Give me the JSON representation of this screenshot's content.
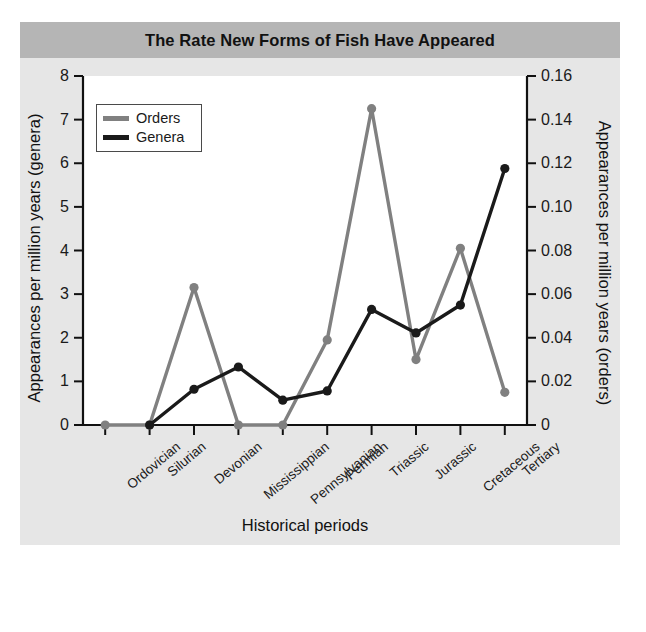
{
  "figure": {
    "title": "The Rate New Forms of Fish Have Appeared",
    "background_color": "#e6e6e6",
    "title_band_color": "#b5b5b5",
    "plot_background_color": "#ffffff"
  },
  "legend": {
    "position": "top-left-inside",
    "entries": [
      {
        "label": "Orders",
        "color": "#808080"
      },
      {
        "label": "Genera",
        "color": "#1a1a1a"
      }
    ]
  },
  "axes": {
    "x_title": "Historical periods",
    "y_left_title": "Appearances per million years (genera)",
    "y_right_title": "Appearances per million years (orders)",
    "y_left_ticks": [
      "0",
      "1",
      "2",
      "3",
      "4",
      "5",
      "6",
      "7",
      "8"
    ],
    "y_right_ticks": [
      "0",
      "0.02",
      "0.04",
      "0.06",
      "0.08",
      "0.10",
      "0.12",
      "0.14",
      "0.16"
    ]
  },
  "chart_data": {
    "type": "line",
    "title": "The Rate New Forms of Fish Have Appeared",
    "xlabel": "Historical periods",
    "ylabel": "Appearances per million years (genera)",
    "y2label": "Appearances per million years (orders)",
    "categories": [
      "Ordovician",
      "Silurian",
      "Devonian",
      "Mississippian",
      "Pennsylvanian",
      "Permian",
      "Triassic",
      "Jurassic",
      "Cretaceous",
      "Tertiary"
    ],
    "ylim": [
      0,
      8
    ],
    "y2lim": [
      0,
      0.16
    ],
    "ytick_step": 1,
    "y2tick_step": 0.02,
    "grid": false,
    "markers": true,
    "series": [
      {
        "name": "Orders",
        "axis": "right",
        "color": "#808080",
        "values": [
          0.0,
          0.0,
          0.063,
          0.0,
          0.0,
          0.039,
          0.145,
          0.03,
          0.081,
          0.015
        ],
        "values_left_scale": [
          0.0,
          0.0,
          3.15,
          0.0,
          0.0,
          1.95,
          7.27,
          1.5,
          4.06,
          0.73
        ]
      },
      {
        "name": "Genera",
        "axis": "left",
        "color": "#1a1a1a",
        "values": [
          null,
          0.0,
          0.82,
          1.33,
          0.57,
          0.78,
          2.65,
          2.11,
          2.75,
          5.88
        ]
      }
    ]
  }
}
